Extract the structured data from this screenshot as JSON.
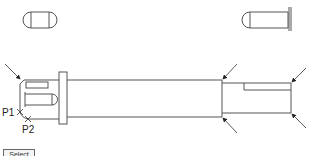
{
  "drawing": {
    "type": "shaft-with-pin",
    "colors": {
      "line": "#555555",
      "arrow": "#222222",
      "background": "#ffffff"
    },
    "views": [
      "left-capsule-top-view",
      "right-pin-side-view",
      "main-shaft-elevation"
    ]
  },
  "points": [
    {
      "id": "P1",
      "label": "P1",
      "x": 20,
      "y": 112
    },
    {
      "id": "P2",
      "label": "P2",
      "x": 28,
      "y": 119
    }
  ],
  "button": {
    "label": "Select"
  }
}
